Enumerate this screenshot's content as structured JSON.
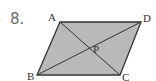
{
  "problem_number": "8.",
  "figure": {
    "type": "parallelogram with diagonals",
    "fill_color": "#b9b9b9",
    "stroke_color": "#333333",
    "vertices": {
      "A": {
        "label": "A",
        "x": 60,
        "y": 22
      },
      "B": {
        "label": "B",
        "x": 37,
        "y": 75
      },
      "C": {
        "label": "C",
        "x": 120,
        "y": 75
      },
      "D": {
        "label": "D",
        "x": 141,
        "y": 22
      }
    },
    "intersection": {
      "label": "P",
      "x": 98,
      "y": 40
    },
    "segments": [
      "AD",
      "DC",
      "CB",
      "BA",
      "AC",
      "BD"
    ]
  }
}
